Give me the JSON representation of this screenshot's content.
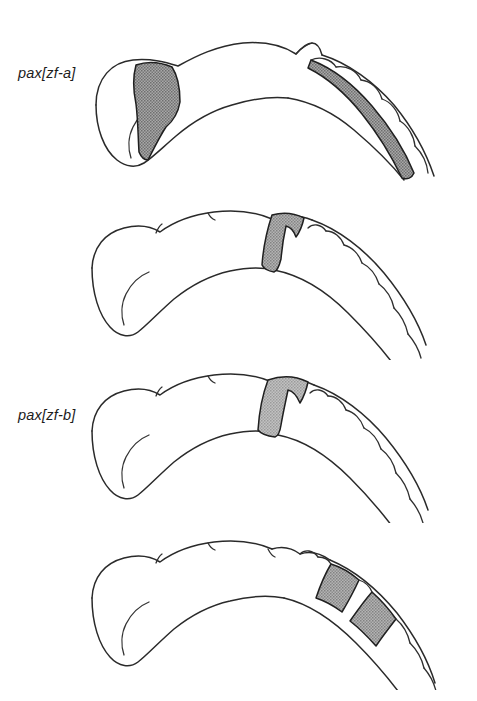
{
  "figure": {
    "type": "scientific-diagram",
    "background_color": "#ffffff",
    "ink_color": "#2a2a2a",
    "shading_colors": {
      "dark_gray": "#8c8c8c",
      "mid_gray": "#9e9e9e",
      "light_gray": "#b0b0b0"
    },
    "panel_count": 4
  },
  "panels": [
    {
      "id": "panel-1",
      "label": "pax[zf-a]",
      "orientation": "anterior-left, posterior-right",
      "expression_domains": [
        {
          "name": "anterior-diencephalic-domain",
          "region": "forebrain / diencephalon",
          "shade": "dark_gray",
          "shape": "broad wedge tapering ventrally"
        },
        {
          "name": "hindbrain-dorsal-band",
          "region": "hindbrain dorsal longitudinal band",
          "shade": "dark_gray",
          "shape": "long curved band extending posteriorly"
        }
      ],
      "rhombomere_boundaries": 6
    },
    {
      "id": "panel-2",
      "label": "pax[zf-b]",
      "orientation": "anterior-left, posterior-right",
      "expression_domains": [
        {
          "name": "midbrain-hindbrain-boundary-band",
          "region": "midbrain-hindbrain boundary",
          "shade": "mid_gray",
          "shape": "narrow transverse stripe"
        }
      ],
      "rhombomere_boundaries": 7
    },
    {
      "id": "panel-3",
      "label": "eng",
      "orientation": "anterior-left, posterior-right",
      "expression_domains": [
        {
          "name": "midbrain-hindbrain-boundary-band",
          "region": "midbrain-hindbrain boundary",
          "shade": "light_gray",
          "shape": "transverse stripe, slightly wider"
        }
      ],
      "rhombomere_boundaries": 7
    },
    {
      "id": "panel-4",
      "label": "zf-Krox20",
      "orientation": "anterior-left, posterior-right",
      "expression_domains": [
        {
          "name": "rhombomere-3-stripe",
          "region": "rhombomere 3",
          "shade": "mid_gray",
          "shape": "transverse stripe"
        },
        {
          "name": "rhombomere-5-stripe",
          "region": "rhombomere 5",
          "shade": "mid_gray",
          "shape": "transverse stripe, separated by one unstained segment"
        }
      ],
      "rhombomere_boundaries": 7
    }
  ]
}
